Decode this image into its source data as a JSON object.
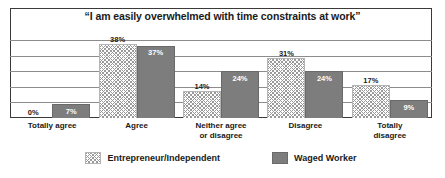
{
  "chart_data": {
    "type": "bar",
    "title": "“I am easily overwhelmed with time constraints at work”",
    "xlabel": "",
    "ylabel": "",
    "ylim": [
      0,
      40
    ],
    "grid": true,
    "gridlines": [
      8,
      16,
      24,
      32,
      40
    ],
    "legend_position": "bottom",
    "value_suffix": "%",
    "categories": [
      "Totally agree",
      "Agree",
      "Neither  agree\nor disagree",
      "Disagree",
      "Totally\ndisagree"
    ],
    "series": [
      {
        "name": "Entrepreneur/Independent",
        "style": "hatched",
        "color": "#ffffff",
        "values": [
          0,
          38,
          14,
          31,
          17
        ],
        "labels": [
          "0%",
          "38%",
          "14%",
          "31%",
          "17%"
        ]
      },
      {
        "name": "Waged Worker",
        "style": "solid",
        "color": "#7d7d7d",
        "values": [
          7,
          37,
          24,
          24,
          9
        ],
        "labels": [
          "7%",
          "37%",
          "24%",
          "24%",
          "9%"
        ]
      }
    ]
  },
  "legend": {
    "items": [
      {
        "label": "Entrepreneur/Independent",
        "swatch": "hatched-swatch-icon"
      },
      {
        "label": "Waged Worker",
        "swatch": "solid-swatch-icon"
      }
    ]
  }
}
